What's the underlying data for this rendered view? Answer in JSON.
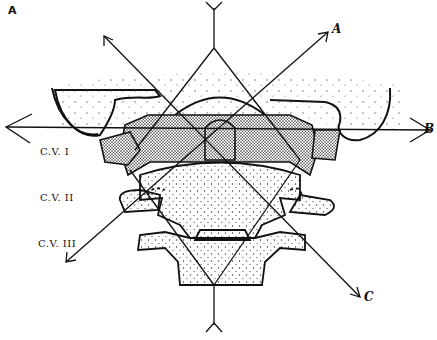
{
  "figure": {
    "panel_label": "A",
    "axes": [
      {
        "id": "A",
        "label": "A"
      },
      {
        "id": "B",
        "label": "B"
      },
      {
        "id": "C",
        "label": "C"
      }
    ],
    "vertebra_levels": [
      {
        "label": "C.V. I"
      },
      {
        "label": "C.V. II"
      },
      {
        "label": "C.V. III"
      }
    ],
    "colors": {
      "ink": "#111111",
      "stipple": "#333333",
      "background": "#ffffff"
    }
  }
}
